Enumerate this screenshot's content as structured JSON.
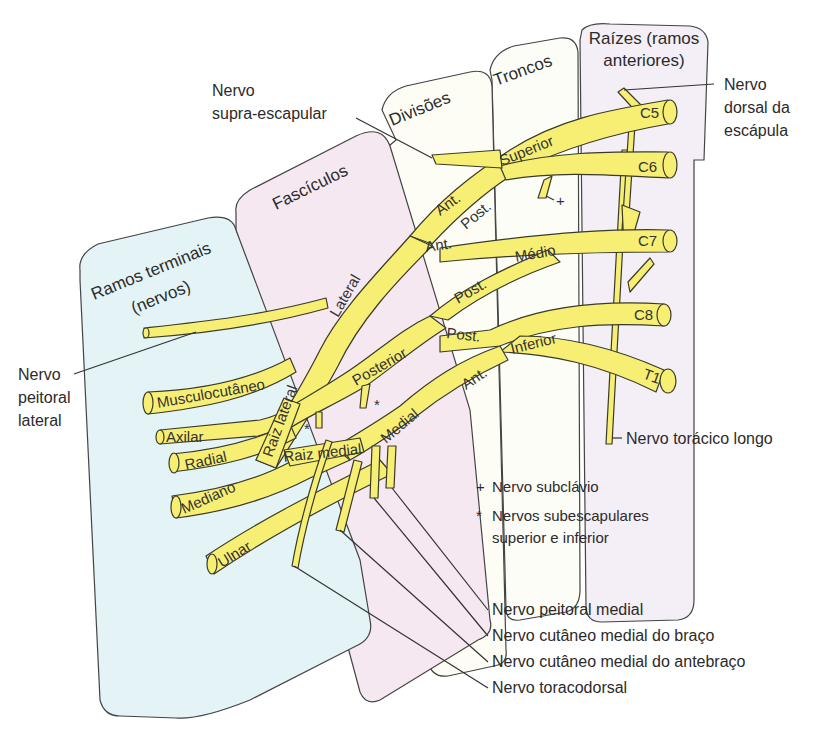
{
  "panels": {
    "terminal": {
      "line1": "Ramos terminais",
      "line2": "(nervos)",
      "color": "#e3f3f6"
    },
    "fasciculos": {
      "title": "Fascículos",
      "color": "#f6e8f0"
    },
    "divisoes": {
      "title": "Divisões",
      "color": "#fdfdf6"
    },
    "troncos": {
      "title": "Troncos",
      "color": "#fdfdf8"
    },
    "raizes": {
      "line1": "Raízes (ramos",
      "line2": "anteriores)",
      "color": "#f4eef6"
    }
  },
  "roots": [
    "C5",
    "C6",
    "C7",
    "C8",
    "T1"
  ],
  "trunks": {
    "superior": "Superior",
    "medio": "Médio",
    "inferior": "Inferior"
  },
  "divisions": {
    "ant": "Ant.",
    "post": "Post."
  },
  "cords": {
    "lateral": "Lateral",
    "posterior": "Posterior",
    "medial": "Medial"
  },
  "terminal_branches": {
    "musculocutaneo": "Musculocutâneo",
    "axilar": "Axilar",
    "radial": "Radial",
    "mediano": "Mediano",
    "ulnar": "Ulnar",
    "raiz_lateral": "Raiz lateral",
    "raiz_medial": "Raiz medial"
  },
  "callouts": {
    "supra_escapular": {
      "line1": "Nervo",
      "line2": "supra-escapular"
    },
    "dorsal_escapula": {
      "line1": "Nervo",
      "line2": "dorsal da",
      "line3": "escápula"
    },
    "peitoral_lateral": {
      "line1": "Nervo",
      "line2": "peitoral",
      "line3": "lateral"
    },
    "toracico_longo": "Nervo torácico longo",
    "peitoral_medial": "Nervo peitoral medial",
    "cutaneo_braco": "Nervo cutâneo medial do braço",
    "cutaneo_antebraco": "Nervo cutâneo medial do antebraço",
    "toracodorsal": "Nervo toracodorsal"
  },
  "legend": {
    "plus_symbol": "+",
    "plus_text": "Nervo subclávio",
    "star_symbol": "*",
    "star_line1": "Nervos subescapulares",
    "star_line2": "superior e inferior"
  },
  "colors": {
    "nerve": "#f7ef74",
    "outline": "#3a3a2a"
  }
}
